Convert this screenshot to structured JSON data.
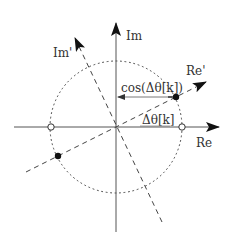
{
  "diagram": {
    "type": "complex-plane-rotation",
    "labels": {
      "re_axis": "Re",
      "im_axis": "Im",
      "re_rotated": "Re'",
      "im_rotated": "Im'",
      "cos_label": "cos(Δθ[k])",
      "angle_label": "Δθ[k]"
    },
    "elements": {
      "unit_circle": "dotted circle",
      "open_markers": [
        "(-1, 0)",
        "(1, 0)"
      ],
      "filled_markers": [
        "rotated point on Re'",
        "rotated point on -Re'"
      ],
      "projection_arrow": "from rotated point to Im axis"
    },
    "colors": {
      "stroke": "#333333",
      "background": "#ffffff"
    }
  }
}
